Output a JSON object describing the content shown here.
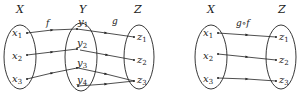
{
  "diagrams": [
    {
      "name": "composition-left",
      "sets": [
        {
          "id": "X",
          "label": "X",
          "elements": [
            {
              "base": "x",
              "sub": "1"
            },
            {
              "base": "x",
              "sub": "2"
            },
            {
              "base": "x",
              "sub": "3"
            }
          ]
        },
        {
          "id": "Y",
          "label": "Y",
          "elements": [
            {
              "base": "y",
              "sub": "1"
            },
            {
              "base": "y",
              "sub": "2"
            },
            {
              "base": "y",
              "sub": "3"
            },
            {
              "base": "y",
              "sub": "4"
            }
          ]
        },
        {
          "id": "Z",
          "label": "Z",
          "elements": [
            {
              "base": "z",
              "sub": "1"
            },
            {
              "base": "z",
              "sub": "2"
            },
            {
              "base": "z",
              "sub": "3"
            }
          ]
        }
      ],
      "functions": [
        {
          "label": "f",
          "from": "X",
          "to": "Y",
          "mapping": [
            [
              "x1",
              "y1"
            ],
            [
              "x2",
              "y2"
            ],
            [
              "x3",
              "y3"
            ]
          ]
        },
        {
          "label": "g",
          "from": "Y",
          "to": "Z",
          "mapping": [
            [
              "y1",
              "z1"
            ],
            [
              "y2",
              "z2"
            ],
            [
              "y3",
              "z3"
            ],
            [
              "y4",
              "z3"
            ]
          ]
        }
      ]
    },
    {
      "name": "composition-right",
      "sets": [
        {
          "id": "X",
          "label": "X",
          "elements": [
            {
              "base": "x",
              "sub": "1"
            },
            {
              "base": "x",
              "sub": "2"
            },
            {
              "base": "x",
              "sub": "3"
            }
          ]
        },
        {
          "id": "Z",
          "label": "Z",
          "elements": [
            {
              "base": "z",
              "sub": "1"
            },
            {
              "base": "z",
              "sub": "2"
            },
            {
              "base": "z",
              "sub": "3"
            }
          ]
        }
      ],
      "functions": [
        {
          "label": "g∘f",
          "from": "X",
          "to": "Z",
          "mapping": [
            [
              "x1",
              "z1"
            ],
            [
              "x2",
              "z2"
            ],
            [
              "x3",
              "z3"
            ]
          ]
        }
      ]
    }
  ],
  "colors": {
    "stroke": "#222222",
    "background": "#ffffff"
  }
}
